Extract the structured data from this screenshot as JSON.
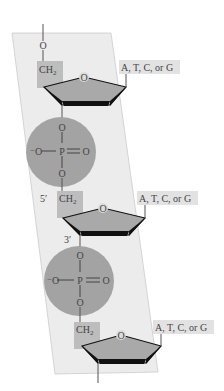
{
  "diagram": {
    "colors": {
      "ribbon": "#e9e9e9",
      "ribbon_edge": "#c8c8c8",
      "sugar_fill": "#a8a8a8",
      "sugar_edge": "#111111",
      "phosphate": "#a3a3a3",
      "label_box": "#b9b9b9",
      "base_box": "#e2e2e2",
      "line": "#555555"
    },
    "nucleotides": [
      {
        "ch2": "CH",
        "ch2_sub": "2",
        "base": "A, T, C, or G",
        "ring_o": "O",
        "prime5": "",
        "prime3": ""
      },
      {
        "ch2": "CH",
        "ch2_sub": "2",
        "base": "A, T, C, or G",
        "ring_o": "O",
        "prime5": "5′",
        "prime3": "3′"
      },
      {
        "ch2": "CH",
        "ch2_sub": "2",
        "base": "A, T, C, or G",
        "ring_o": "O",
        "prime5": "",
        "prime3": ""
      }
    ],
    "phosphates": [
      {
        "top_o": "O",
        "left_o": "⁻O",
        "p": "P",
        "right_o": "O",
        "bottom_o": "O"
      },
      {
        "top_o": "O",
        "left_o": "⁻O",
        "p": "P",
        "right_o": "O",
        "bottom_o": "O"
      }
    ],
    "top_o": "O"
  }
}
